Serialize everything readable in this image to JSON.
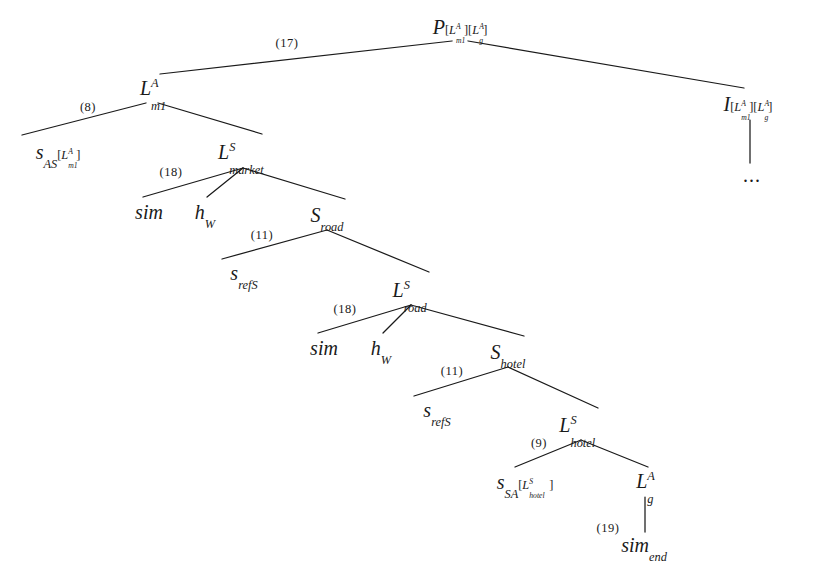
{
  "figure": {
    "kind": "derivation-tree",
    "background_color": "#ffffff",
    "ink_color": "#1a1a1a",
    "width": 822,
    "height": 572
  },
  "nodes": [
    {
      "id": "root",
      "text": "P[L^A_m1][L^A_g]",
      "x": 460,
      "y": 27
    },
    {
      "id": "lm1",
      "text": "L^A_m1",
      "x": 152,
      "y": 88
    },
    {
      "id": "i-node",
      "text": "I[L^A_m1][L^A_g]",
      "x": 748,
      "y": 104
    },
    {
      "id": "dots",
      "text": "...",
      "x": 752,
      "y": 175
    },
    {
      "id": "s-as",
      "text": "s_AS[L^A_m1]",
      "x": 58,
      "y": 152
    },
    {
      "id": "l-market",
      "text": "L^S_market",
      "x": 243,
      "y": 152
    },
    {
      "id": "sim-1",
      "text": "sim",
      "x": 149,
      "y": 212
    },
    {
      "id": "hw-1",
      "text": "h_W",
      "x": 205,
      "y": 212
    },
    {
      "id": "s-road",
      "text": "S_road",
      "x": 327,
      "y": 215
    },
    {
      "id": "s-refs-1",
      "text": "s_refS",
      "x": 244,
      "y": 273
    },
    {
      "id": "l-road",
      "text": "L^S_road",
      "x": 411,
      "y": 290
    },
    {
      "id": "sim-2",
      "text": "sim",
      "x": 324,
      "y": 348
    },
    {
      "id": "hw-2",
      "text": "h_W",
      "x": 381,
      "y": 348
    },
    {
      "id": "s-hotel",
      "text": "S_hotel",
      "x": 508,
      "y": 352
    },
    {
      "id": "s-refs-2",
      "text": "s_refS",
      "x": 437,
      "y": 410
    },
    {
      "id": "l-hotel",
      "text": "L^S_hotel",
      "x": 581,
      "y": 425
    },
    {
      "id": "s-sa",
      "text": "s_SA[L^S_hotel]",
      "x": 525,
      "y": 482
    },
    {
      "id": "lg",
      "text": "L^A_g",
      "x": 645,
      "y": 481
    },
    {
      "id": "sim-end",
      "text": "sim_end",
      "x": 644,
      "y": 545
    }
  ],
  "edge_labels": [
    {
      "id": "lbl-17",
      "text": "(17)",
      "x": 287,
      "y": 43
    },
    {
      "id": "lbl-8",
      "text": "(8)",
      "x": 88,
      "y": 107
    },
    {
      "id": "lbl-18a",
      "text": "(18)",
      "x": 171,
      "y": 172
    },
    {
      "id": "lbl-11a",
      "text": "(11)",
      "x": 262,
      "y": 235
    },
    {
      "id": "lbl-18b",
      "text": "(18)",
      "x": 345,
      "y": 309
    },
    {
      "id": "lbl-11b",
      "text": "(11)",
      "x": 452,
      "y": 371
    },
    {
      "id": "lbl-9",
      "text": "(9)",
      "x": 539,
      "y": 443
    },
    {
      "id": "lbl-19",
      "text": "(19)",
      "x": 608,
      "y": 528
    }
  ],
  "edges": [
    {
      "id": "root-lm1",
      "from": [
        452,
        41
      ],
      "to": [
        160,
        74
      ]
    },
    {
      "id": "root-i",
      "from": [
        468,
        41
      ],
      "to": [
        744,
        88
      ]
    },
    {
      "id": "i-dots",
      "from": [
        750,
        120
      ],
      "to": [
        750,
        163
      ]
    },
    {
      "id": "lm1-sas",
      "from": [
        146,
        103
      ],
      "to": [
        22,
        135
      ]
    },
    {
      "id": "lm1-lmarket",
      "from": [
        158,
        103
      ],
      "to": [
        262,
        134
      ]
    },
    {
      "id": "lmarket-sim1",
      "from": [
        243,
        168
      ],
      "to": [
        143,
        197
      ]
    },
    {
      "id": "lmarket-hw1",
      "from": [
        243,
        168
      ],
      "to": [
        207,
        197
      ]
    },
    {
      "id": "lmarket-sroad",
      "from": [
        243,
        168
      ],
      "to": [
        345,
        199
      ]
    },
    {
      "id": "sroad-srefs1",
      "from": [
        327,
        230
      ],
      "to": [
        222,
        259
      ]
    },
    {
      "id": "sroad-lroad",
      "from": [
        327,
        230
      ],
      "to": [
        429,
        272
      ]
    },
    {
      "id": "lroad-sim2",
      "from": [
        411,
        305
      ],
      "to": [
        318,
        333
      ]
    },
    {
      "id": "lroad-hw2",
      "from": [
        411,
        305
      ],
      "to": [
        383,
        333
      ]
    },
    {
      "id": "lroad-shotel",
      "from": [
        411,
        305
      ],
      "to": [
        524,
        336
      ]
    },
    {
      "id": "shotel-srefs2",
      "from": [
        508,
        367
      ],
      "to": [
        414,
        396
      ]
    },
    {
      "id": "shotel-lhotel",
      "from": [
        508,
        367
      ],
      "to": [
        598,
        408
      ]
    },
    {
      "id": "lhotel-ssa",
      "from": [
        581,
        440
      ],
      "to": [
        515,
        467
      ]
    },
    {
      "id": "lhotel-lg",
      "from": [
        581,
        440
      ],
      "to": [
        648,
        467
      ]
    },
    {
      "id": "lg-simend",
      "from": [
        645,
        497
      ],
      "to": [
        645,
        532
      ]
    }
  ]
}
